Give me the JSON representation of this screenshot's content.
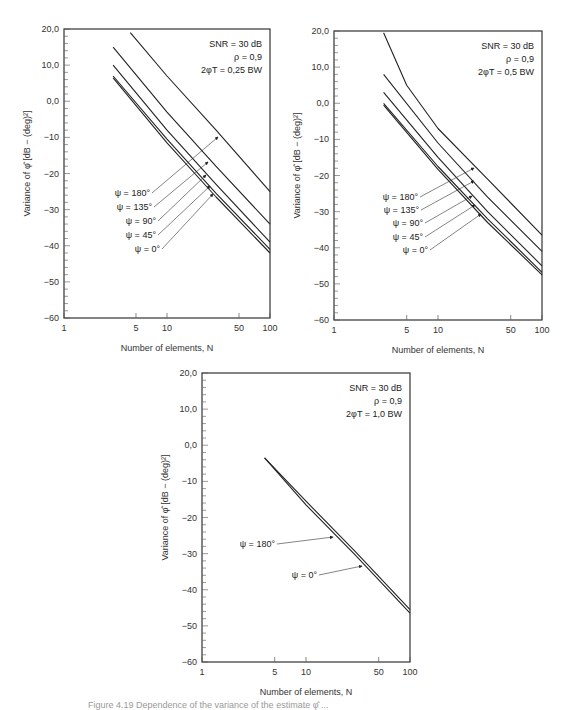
{
  "chart_data": [
    {
      "type": "line",
      "panel": "top-left",
      "frame": {
        "x": 64,
        "y": 29,
        "w": 206,
        "h": 289
      },
      "title": "",
      "xlabel": "Number of elements, N",
      "ylabel": "Variance of φ̂ [dB − (deg)²]",
      "xscale": "log",
      "xlim": [
        1,
        100
      ],
      "ylim": [
        -60,
        20
      ],
      "xticks": [
        1,
        5,
        10,
        50,
        100
      ],
      "xtick_labels": [
        "1",
        "5",
        "10",
        "50",
        "100"
      ],
      "yticks": [
        20,
        10,
        0,
        -10,
        -20,
        -30,
        -40,
        -50,
        -60
      ],
      "ytick_labels": [
        "20,0",
        "10,0",
        "0,0",
        "−10",
        "−20",
        "−30",
        "−40",
        "−50",
        "−60"
      ],
      "grid": false,
      "annotation": [
        "SNR = 30 dB",
        "ρ = 0,9",
        "2φT = 0,25 BW"
      ],
      "series": [
        {
          "name": "ψ = 180°",
          "x": [
            4.4,
            10,
            30,
            100
          ],
          "y": [
            19,
            7,
            -8,
            -25
          ]
        },
        {
          "name": "ψ = 135°",
          "x": [
            3,
            10,
            30,
            100
          ],
          "y": [
            15,
            -3,
            -18,
            -34
          ]
        },
        {
          "name": "ψ = 90°",
          "x": [
            3,
            10,
            30,
            100
          ],
          "y": [
            10,
            -8,
            -23,
            -39
          ]
        },
        {
          "name": "ψ = 45°",
          "x": [
            3,
            10,
            30,
            100
          ],
          "y": [
            7,
            -10.5,
            -25.5,
            -41
          ]
        },
        {
          "name": "ψ = 0°",
          "x": [
            3,
            10,
            30,
            100
          ],
          "y": [
            6.5,
            -11.5,
            -26.5,
            -42
          ]
        }
      ],
      "labels": [
        {
          "text": "ψ = 180°",
          "tx": 150,
          "ty": 196,
          "ax": 218,
          "ay": 137
        },
        {
          "text": "ψ = 135°",
          "tx": 152,
          "ty": 210,
          "ax": 208,
          "ay": 162
        },
        {
          "text": "ψ = 90°",
          "tx": 156,
          "ty": 224,
          "ax": 206,
          "ay": 175
        },
        {
          "text": "ψ = 45°",
          "tx": 156,
          "ty": 238,
          "ax": 210,
          "ay": 186
        },
        {
          "text": "ψ = 0°",
          "tx": 160,
          "ty": 252,
          "ax": 213,
          "ay": 194
        }
      ]
    },
    {
      "type": "line",
      "panel": "top-right",
      "frame": {
        "x": 334,
        "y": 31,
        "w": 208,
        "h": 289
      },
      "title": "",
      "xlabel": "Number of elements, N",
      "ylabel": "Variance of φ̂ [dB − (deg)²]",
      "xscale": "log",
      "xlim": [
        1,
        100
      ],
      "ylim": [
        -60,
        20
      ],
      "xticks": [
        1,
        5,
        10,
        50,
        100
      ],
      "xtick_labels": [
        "1",
        "5",
        "10",
        "50",
        "100"
      ],
      "yticks": [
        20,
        10,
        0,
        -10,
        -20,
        -30,
        -40,
        -50,
        -60
      ],
      "ytick_labels": [
        "20,0",
        "10,0",
        "0,0",
        "−10",
        "−20",
        "−30",
        "−40",
        "−50",
        "−60"
      ],
      "grid": false,
      "annotation": [
        "SNR = 30 dB",
        "ρ = 0,9",
        "2φT = 0,5 BW"
      ],
      "series": [
        {
          "name": "ψ = 180°",
          "x": [
            3,
            5,
            10,
            30,
            100
          ],
          "y": [
            19.5,
            5,
            -7,
            -21,
            -36.5
          ]
        },
        {
          "name": "ψ = 135°",
          "x": [
            3,
            10,
            30,
            100
          ],
          "y": [
            8,
            -11,
            -26,
            -41
          ]
        },
        {
          "name": "ψ = 90°",
          "x": [
            3,
            10,
            30,
            100
          ],
          "y": [
            3,
            -15,
            -30,
            -45
          ]
        },
        {
          "name": "ψ = 45°",
          "x": [
            3,
            10,
            30,
            100
          ],
          "y": [
            0,
            -17.5,
            -32,
            -46.8
          ]
        },
        {
          "name": "ψ = 0°",
          "x": [
            3,
            10,
            30,
            100
          ],
          "y": [
            -0.5,
            -18.3,
            -33,
            -47.5
          ]
        }
      ],
      "labels": [
        {
          "text": "ψ = 180°",
          "tx": 418,
          "ty": 200,
          "ax": 474,
          "ay": 168
        },
        {
          "text": "ψ = 135°",
          "tx": 419,
          "ty": 213,
          "ax": 474,
          "ay": 181
        },
        {
          "text": "ψ = 90°",
          "tx": 423,
          "ty": 226,
          "ax": 472,
          "ay": 196
        },
        {
          "text": "ψ = 45°",
          "tx": 423,
          "ty": 240,
          "ax": 475,
          "ay": 205
        },
        {
          "text": "ψ = 0°",
          "tx": 428,
          "ty": 253,
          "ax": 481,
          "ay": 214
        }
      ]
    },
    {
      "type": "line",
      "panel": "bottom",
      "frame": {
        "x": 202,
        "y": 373,
        "w": 208,
        "h": 289
      },
      "title": "",
      "xlabel": "Number of elements, N",
      "ylabel": "Variance of φ̂ [dB − (deg)²]",
      "xscale": "log",
      "xlim": [
        1,
        100
      ],
      "ylim": [
        -60,
        20
      ],
      "xticks": [
        1,
        5,
        10,
        50,
        100
      ],
      "xtick_labels": [
        "1",
        "5",
        "10",
        "50",
        "100"
      ],
      "yticks": [
        20,
        10,
        0,
        -10,
        -20,
        -30,
        -40,
        -50,
        -60
      ],
      "ytick_labels": [
        "20,0",
        "10,0",
        "0,0",
        "−10",
        "−20",
        "−30",
        "−40",
        "−50",
        "−60"
      ],
      "grid": false,
      "annotation": [
        "SNR = 30 dB",
        "ρ = 0,9",
        "2φT = 1,0 BW"
      ],
      "series": [
        {
          "name": "ψ = 180°",
          "x": [
            4,
            10,
            30,
            100
          ],
          "y": [
            -3.5,
            -15.5,
            -29.5,
            -45.5
          ]
        },
        {
          "name": "ψ = 0°",
          "x": [
            4,
            10,
            30,
            100
          ],
          "y": [
            -3.5,
            -16.5,
            -30.5,
            -46.5
          ]
        }
      ],
      "labels": [
        {
          "text": "ψ = 180°",
          "tx": 275,
          "ty": 547,
          "ax": 333,
          "ay": 537
        },
        {
          "text": "ψ = 0°",
          "tx": 317,
          "ty": 578,
          "ax": 362,
          "ay": 566
        }
      ]
    }
  ],
  "caption": "Figure 4.19 Dependence of the variance of the estimate φ̂ ..."
}
